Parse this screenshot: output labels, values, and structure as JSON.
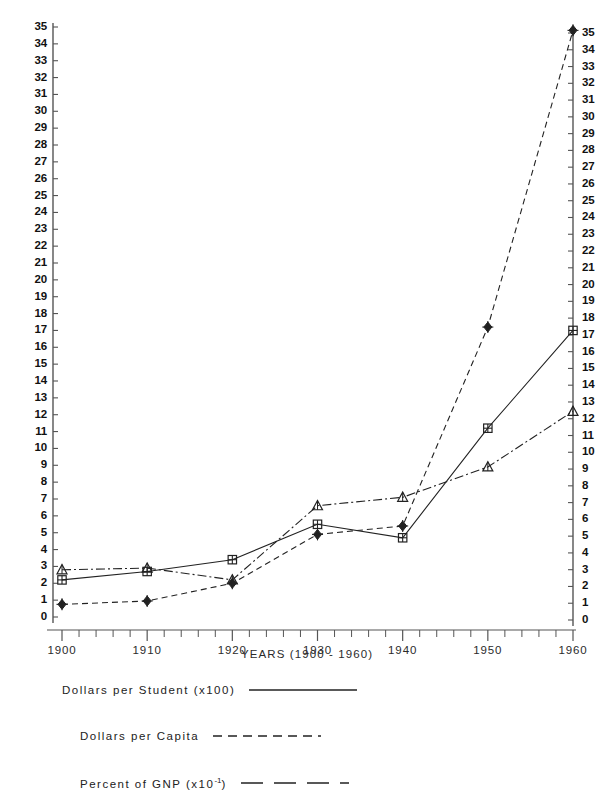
{
  "chart_data": {
    "type": "line",
    "title": "",
    "xlabel": "YEARS (1900 - 1960)",
    "ylabel": "",
    "x": [
      1900,
      1910,
      1920,
      1930,
      1940,
      1950,
      1960
    ],
    "xtick_labels": [
      "1900",
      "1910",
      "1920",
      "1930",
      "1940",
      "1950",
      "1960"
    ],
    "xlim": [
      1900,
      1960
    ],
    "ylim": [
      0,
      35
    ],
    "ytick_labels": [
      "0",
      "1",
      "2",
      "3",
      "4",
      "5",
      "6",
      "7",
      "8",
      "9",
      "10",
      "11",
      "12",
      "13",
      "14",
      "15",
      "16",
      "17",
      "18",
      "19",
      "20",
      "21",
      "22",
      "23",
      "24",
      "25",
      "26",
      "27",
      "28",
      "29",
      "30",
      "31",
      "32",
      "33",
      "34",
      "35"
    ],
    "left_axis_label": "",
    "right_axis_label": "",
    "grid": false,
    "legend_position": "below",
    "series": [
      {
        "name": "Dollars per Student (x100)",
        "marker": "square",
        "linestyle": "solid",
        "color": "#222222",
        "values": [
          2.2,
          2.7,
          3.4,
          5.5,
          4.7,
          11.2,
          17.0
        ]
      },
      {
        "name": "Dollars per Capita",
        "marker": "diamond",
        "linestyle": "dashed",
        "color": "#222222",
        "values": [
          0.75,
          0.95,
          2.0,
          4.9,
          5.4,
          17.2,
          34.8
        ]
      },
      {
        "name": "Percent of GNP (x10⁻¹)",
        "marker": "triangle",
        "linestyle": "dashdot",
        "color": "#222222",
        "values": [
          2.8,
          2.9,
          2.2,
          6.6,
          7.1,
          8.9,
          12.2
        ]
      }
    ]
  },
  "axes": {
    "left_ticks": [
      "35",
      "34",
      "33",
      "32",
      "31",
      "30",
      "29",
      "28",
      "27",
      "26",
      "25",
      "24",
      "23",
      "22",
      "21",
      "20",
      "19",
      "18",
      "17",
      "16",
      "15",
      "14",
      "13",
      "12",
      "11",
      "10",
      "9",
      "8",
      "7",
      "6",
      "5",
      "4",
      "3",
      "2",
      "1",
      "0"
    ],
    "right_ticks": [
      "35",
      "34",
      "33",
      "32",
      "31",
      "30",
      "29",
      "28",
      "27",
      "26",
      "25",
      "24",
      "23",
      "22",
      "21",
      "20",
      "19",
      "18",
      "17",
      "16",
      "15",
      "14",
      "13",
      "12",
      "11",
      "10",
      "9",
      "8",
      "7",
      "6",
      "5",
      "4",
      "3",
      "2",
      "1",
      "0"
    ],
    "x_labels": [
      "1900",
      "1910",
      "1920",
      "1930",
      "1940",
      "1950",
      "1960"
    ],
    "x_title": "YEARS (1900 - 1960)"
  },
  "legend": {
    "entries": [
      {
        "label": "Dollars per Student (x100)",
        "style": "solid",
        "sup": ""
      },
      {
        "label": "Dollars per Capita",
        "style": "dashed",
        "sup": ""
      },
      {
        "label": "Percent of GNP (x10",
        "style": "longdash",
        "sup": "-1",
        "suffix": ")"
      }
    ]
  },
  "colors": {
    "ink": "#222222",
    "axis": "#555555",
    "background": "#ffffff"
  }
}
